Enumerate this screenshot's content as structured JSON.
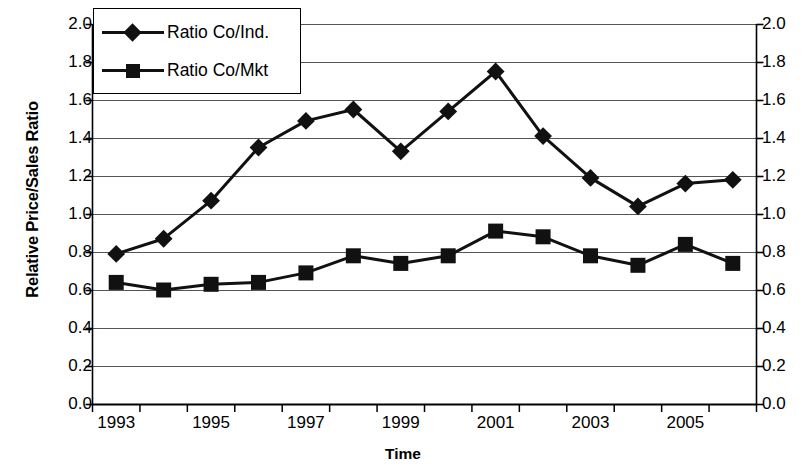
{
  "chart_data": {
    "type": "line",
    "title": "",
    "xlabel": "Time",
    "ylabel": "Relative Price/Sales Ratio",
    "x": [
      1993,
      1994,
      1995,
      1996,
      1997,
      1998,
      1999,
      2000,
      2001,
      2002,
      2003,
      2004,
      2005,
      2006
    ],
    "categories": [
      "1993",
      "1994",
      "1995",
      "1996",
      "1997",
      "1998",
      "1999",
      "2000",
      "2001",
      "2002",
      "2003",
      "2004",
      "2005",
      "2006"
    ],
    "x_tick_labels_shown": [
      "1993",
      "",
      "1995",
      "",
      "1997",
      "",
      "1999",
      "",
      "2001",
      "",
      "2003",
      "",
      "2005",
      ""
    ],
    "series": [
      {
        "name": "Ratio Co/Ind.",
        "marker": "diamond",
        "color": "#111111",
        "values": [
          0.79,
          0.87,
          1.07,
          1.35,
          1.49,
          1.55,
          1.33,
          1.54,
          1.75,
          1.41,
          1.19,
          1.04,
          1.16,
          1.18
        ]
      },
      {
        "name": "Ratio Co/Mkt",
        "marker": "square",
        "color": "#111111",
        "values": [
          0.64,
          0.6,
          0.63,
          0.64,
          0.69,
          0.78,
          0.74,
          0.78,
          0.91,
          0.88,
          0.78,
          0.73,
          0.84,
          0.74
        ]
      }
    ],
    "ylim": [
      0.0,
      2.0
    ],
    "ytick_values": [
      0.0,
      0.2,
      0.4,
      0.6,
      0.8,
      1.0,
      1.2,
      1.4,
      1.6,
      1.8,
      2.0
    ],
    "ytick_labels": [
      "0.0",
      "0.2",
      "0.4",
      "0.6",
      "0.8",
      "1.0",
      "1.2",
      "1.4",
      "1.6",
      "1.8",
      "2.0"
    ],
    "secondary_y_axis": true,
    "secondary_ytick_labels": [
      "0.0",
      "0.2",
      "0.4",
      "0.6",
      "0.8",
      "1.0",
      "1.2",
      "1.4",
      "1.6",
      "1.8",
      "2.0"
    ],
    "grid": "horizontal",
    "legend_position": "top-left-inside",
    "legend_entries": [
      "Ratio Co/Ind.",
      "Ratio Co/Mkt"
    ]
  },
  "legend": {
    "entries": [
      {
        "label": "Ratio Co/Ind."
      },
      {
        "label": "Ratio Co/Mkt"
      }
    ]
  },
  "axes": {
    "y_title": "Relative Price/Sales Ratio",
    "x_title": "Time"
  },
  "colors": {
    "series": "#111111",
    "grid": "#555555",
    "axis": "#000000",
    "background": "#ffffff"
  }
}
